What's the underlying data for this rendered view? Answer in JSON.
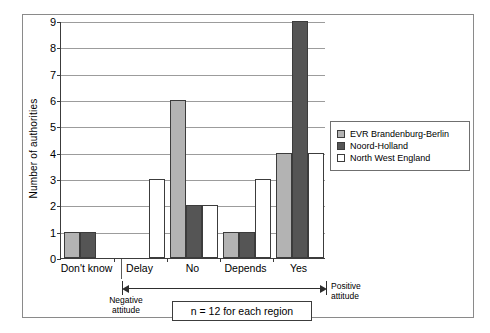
{
  "chart_data": {
    "type": "bar",
    "title": "",
    "subtitle": "",
    "xlabel": "",
    "ylabel": "Number of authorities",
    "categories": [
      "Don't know",
      "Delay",
      "No",
      "Depends",
      "Yes"
    ],
    "series": [
      {
        "name": "EVR Brandenburg-Berlin",
        "color": "#b3b3b3",
        "values": [
          1,
          0,
          6,
          1,
          4
        ]
      },
      {
        "name": "Noord-Holland",
        "color": "#555555",
        "values": [
          1,
          0,
          2,
          1,
          9
        ]
      },
      {
        "name": "North West England",
        "color": "#ffffff",
        "values": [
          0,
          3,
          2,
          3,
          4
        ]
      }
    ],
    "ylim": [
      0,
      9
    ],
    "yticks": [
      0,
      1,
      2,
      3,
      4,
      5,
      6,
      7,
      8,
      9
    ],
    "ytick_labels": [
      "0",
      "1",
      "2",
      "3",
      "4",
      "5",
      "6",
      "7",
      "8",
      "9"
    ],
    "grid": true,
    "legend_position": "right",
    "annotations": {
      "negative_attitude": "Negative\nattitude",
      "negative_attitude_line1": "Negative",
      "negative_attitude_line2": "attitude",
      "positive_attitude_line1": "Positive",
      "positive_attitude_line2": "attitude",
      "sample_note": "n = 12 for each region"
    }
  },
  "legend": {
    "items": [
      {
        "label": "EVR Brandenburg-Berlin",
        "color": "#b3b3b3"
      },
      {
        "label": "Noord-Holland",
        "color": "#555555"
      },
      {
        "label": "North West England",
        "color": "#ffffff"
      }
    ]
  }
}
